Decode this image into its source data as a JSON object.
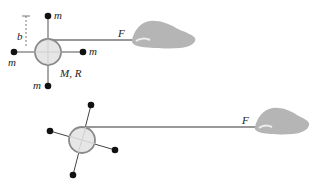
{
  "diagram": {
    "top": {
      "labels": {
        "mass_top": "m",
        "mass_left": "m",
        "mass_right": "m",
        "mass_bottom": "m",
        "disk": "M, R",
        "distance": "b",
        "force": "F"
      }
    },
    "bottom": {
      "labels": {
        "force": "F"
      }
    },
    "colors": {
      "disk_fill": "#e6e6e6",
      "disk_stroke": "#8a8a8a",
      "mass": "#111111",
      "string": "#777777",
      "hand": "#b5b5b5"
    }
  }
}
